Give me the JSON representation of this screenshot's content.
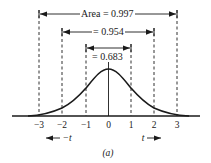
{
  "figure": {
    "caption": "(a)",
    "brackets": [
      {
        "label": "Area = 0.997",
        "from": -3,
        "to": 3
      },
      {
        "label": "= 0.954",
        "from": -2,
        "to": 2
      },
      {
        "label": "= 0.683",
        "from": -1,
        "to": 1
      }
    ],
    "axis": {
      "ticks": [
        "−3",
        "−2",
        "−1",
        "0",
        "1",
        "2",
        "3"
      ],
      "left_direction_label": "−t",
      "right_direction_label": "t"
    },
    "curve": "standard normal density (bell curve)",
    "colors": {
      "ink": "#1a1a1a",
      "background": "#ffffff"
    }
  }
}
